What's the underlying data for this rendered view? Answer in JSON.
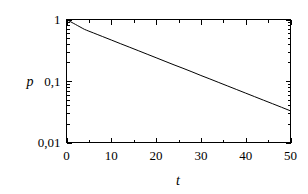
{
  "chart_data": {
    "type": "line",
    "title": "",
    "subtitle": "",
    "xlabel": "t",
    "ylabel": "p",
    "xlim": [
      0,
      50
    ],
    "ylim": [
      0.01,
      1
    ],
    "yscale": "log",
    "xscale": "linear",
    "grid": false,
    "legend": null,
    "decimal_separator": ",",
    "xticks": [
      0,
      10,
      20,
      30,
      40,
      50
    ],
    "xtick_labels": [
      "0",
      "10",
      "20",
      "30",
      "40",
      "50"
    ],
    "xminor_step": 5,
    "yticks": [
      1,
      0.1,
      0.01
    ],
    "ytick_labels": [
      "1",
      "0,1",
      "0,01"
    ],
    "yminor_decade_multipliers": [
      2,
      3,
      4,
      5,
      6,
      7,
      8,
      9
    ],
    "series": [
      {
        "name": "p(t)",
        "color": "#000000",
        "x": [
          0,
          0.5,
          1,
          1.5,
          2,
          2.5,
          3,
          3.5,
          4,
          4.5,
          5,
          6,
          7,
          8,
          10,
          12,
          14,
          16,
          18,
          20,
          22,
          24,
          26,
          28,
          30,
          32,
          34,
          36,
          38,
          40,
          42,
          44,
          46,
          48,
          50
        ],
        "y": [
          1.0,
          0.955,
          0.912,
          0.871,
          0.832,
          0.794,
          0.759,
          0.724,
          0.692,
          0.668,
          0.646,
          0.605,
          0.566,
          0.53,
          0.464,
          0.406,
          0.356,
          0.312,
          0.273,
          0.239,
          0.209,
          0.183,
          0.161,
          0.141,
          0.123,
          0.108,
          0.0945,
          0.0828,
          0.0725,
          0.0635,
          0.0556,
          0.0487,
          0.0427,
          0.0374,
          0.0327
        ]
      }
    ],
    "annotations": []
  },
  "axis": {
    "y_label": "p",
    "x_label": "t"
  }
}
